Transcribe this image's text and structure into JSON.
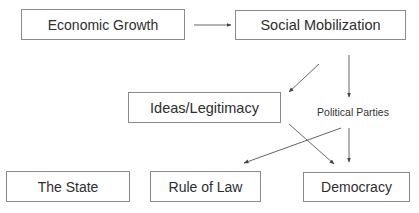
{
  "diagram": {
    "type": "flow-diagram",
    "nodes": [
      {
        "id": "econ",
        "label": "Economic Growth",
        "shape": "box"
      },
      {
        "id": "social",
        "label": "Social Mobilization",
        "shape": "box"
      },
      {
        "id": "ideas",
        "label": "Ideas/Legitimacy",
        "shape": "box"
      },
      {
        "id": "parties",
        "label": "Political Parties",
        "shape": "text"
      },
      {
        "id": "state",
        "label": "The State",
        "shape": "box"
      },
      {
        "id": "rule",
        "label": "Rule of Law",
        "shape": "box"
      },
      {
        "id": "demo",
        "label": "Democracy",
        "shape": "box"
      }
    ],
    "edges": [
      {
        "from": "econ",
        "to": "social"
      },
      {
        "from": "social",
        "to": "ideas"
      },
      {
        "from": "social",
        "to": "parties"
      },
      {
        "from": "ideas",
        "to": "demo"
      },
      {
        "from": "parties",
        "to": "rule"
      },
      {
        "from": "parties",
        "to": "demo"
      }
    ],
    "colors": {
      "stroke": "#555555",
      "border": "#8a8a8a",
      "text": "#2e2e2e"
    }
  }
}
